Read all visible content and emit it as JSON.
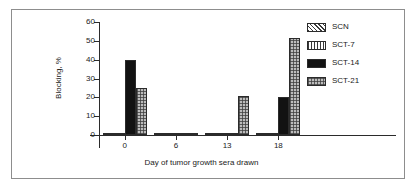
{
  "chart_data": {
    "type": "bar",
    "title": "",
    "xlabel": "Day of tumor growth sera drawn",
    "ylabel": "Blocking, %",
    "categories": [
      "0",
      "6",
      "13",
      "18"
    ],
    "ylim": [
      0,
      60
    ],
    "yticks": [
      0,
      10,
      20,
      30,
      40,
      50,
      60
    ],
    "grid": false,
    "legend_position": "right",
    "series": [
      {
        "name": "SCN",
        "pattern": "diagonal-hatch",
        "values": [
          0,
          0,
          0,
          0
        ]
      },
      {
        "name": "SCT-7",
        "pattern": "vertical-lines",
        "values": [
          0,
          0,
          0,
          0
        ]
      },
      {
        "name": "SCT-14",
        "pattern": "solid-black",
        "values": [
          40,
          0,
          0,
          20
        ]
      },
      {
        "name": "SCT-21",
        "pattern": "checkered-gray",
        "values": [
          25,
          0,
          20.5,
          51.5
        ]
      }
    ]
  },
  "axis": {
    "y_tick_labels": [
      "0",
      "10",
      "20",
      "30",
      "40",
      "50",
      "60"
    ],
    "x_tick_labels": [
      "0",
      "6",
      "13",
      "18"
    ],
    "x_title": "Day of tumor growth sera drawn",
    "y_title": "Blocking, %"
  },
  "legend": {
    "items": [
      {
        "label": "SCN"
      },
      {
        "label": "SCT-7"
      },
      {
        "label": "SCT-14"
      },
      {
        "label": "SCT-21"
      }
    ]
  },
  "colors": {
    "axis": "#2b2b2b",
    "frame": "#8d8d8d",
    "text": "#1a1a1a",
    "solid_bar": "#121212",
    "check_bar": "#bcbcbc",
    "background": "#ffffff"
  }
}
